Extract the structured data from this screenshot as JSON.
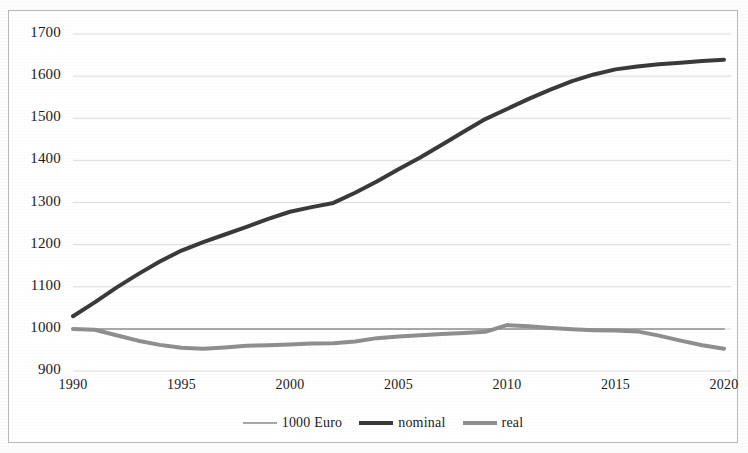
{
  "chart_data": {
    "type": "line",
    "title": "",
    "subtitle": "",
    "xlabel": "",
    "ylabel": "",
    "xlim": [
      1990,
      2020
    ],
    "ylim": [
      900,
      1700
    ],
    "grid": true,
    "legend_position": "bottom",
    "x_ticks": [
      "1990",
      "1995",
      "2000",
      "2005",
      "2010",
      "2015",
      "2020"
    ],
    "y_ticks": [
      "900",
      "1000",
      "1100",
      "1200",
      "1300",
      "1400",
      "1500",
      "1600",
      "1700"
    ],
    "x": [
      1990,
      1991,
      1992,
      1993,
      1994,
      1995,
      1996,
      1997,
      1998,
      1999,
      2000,
      2001,
      2002,
      2003,
      2004,
      2005,
      2006,
      2007,
      2008,
      2009,
      2010,
      2011,
      2012,
      2013,
      2014,
      2015,
      2016,
      2017,
      2018,
      2019,
      2020
    ],
    "series": [
      {
        "name": "1000 Euro",
        "color": "#a8a8a8",
        "width": 2,
        "values": [
          1000,
          1000,
          1000,
          1000,
          1000,
          1000,
          1000,
          1000,
          1000,
          1000,
          1000,
          1000,
          1000,
          1000,
          1000,
          1000,
          1000,
          1000,
          1000,
          1000,
          1000,
          1000,
          1000,
          1000,
          1000,
          1000,
          1000,
          1000,
          1000,
          1000,
          1000
        ]
      },
      {
        "name": "nominal",
        "color": "#3a3a3a",
        "width": 4,
        "values": [
          1030,
          1063,
          1098,
          1130,
          1160,
          1186,
          1206,
          1224,
          1242,
          1261,
          1278,
          1289,
          1299,
          1323,
          1350,
          1379,
          1407,
          1437,
          1468,
          1498,
          1522,
          1546,
          1568,
          1588,
          1604,
          1616,
          1623,
          1628,
          1632,
          1636,
          1639
        ]
      },
      {
        "name": "real",
        "color": "#8f8f8f",
        "width": 4,
        "values": [
          1000,
          998,
          985,
          972,
          962,
          955,
          953,
          956,
          960,
          961,
          963,
          965,
          966,
          970,
          978,
          982,
          985,
          988,
          990,
          993,
          1009,
          1006,
          1002,
          999,
          997,
          996,
          994,
          984,
          972,
          961,
          953
        ]
      }
    ]
  },
  "legend": {
    "items": [
      {
        "label": "1000 Euro"
      },
      {
        "label": "nominal"
      },
      {
        "label": "real"
      }
    ]
  }
}
